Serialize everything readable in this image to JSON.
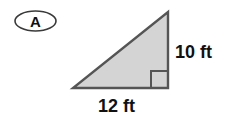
{
  "figure": {
    "problem_label": "A",
    "shape_name": "right-triangle",
    "fill_color": "#d4d4d4",
    "stroke_color": "#555555",
    "background_color": "#ffffff",
    "text_color": "#111111",
    "right_angle_marker": "right-angle-square",
    "labels": {
      "height": "10 ft",
      "base": "12 ft"
    },
    "measurements": {
      "base_value": 12,
      "height_value": 10,
      "unit": "ft"
    }
  }
}
